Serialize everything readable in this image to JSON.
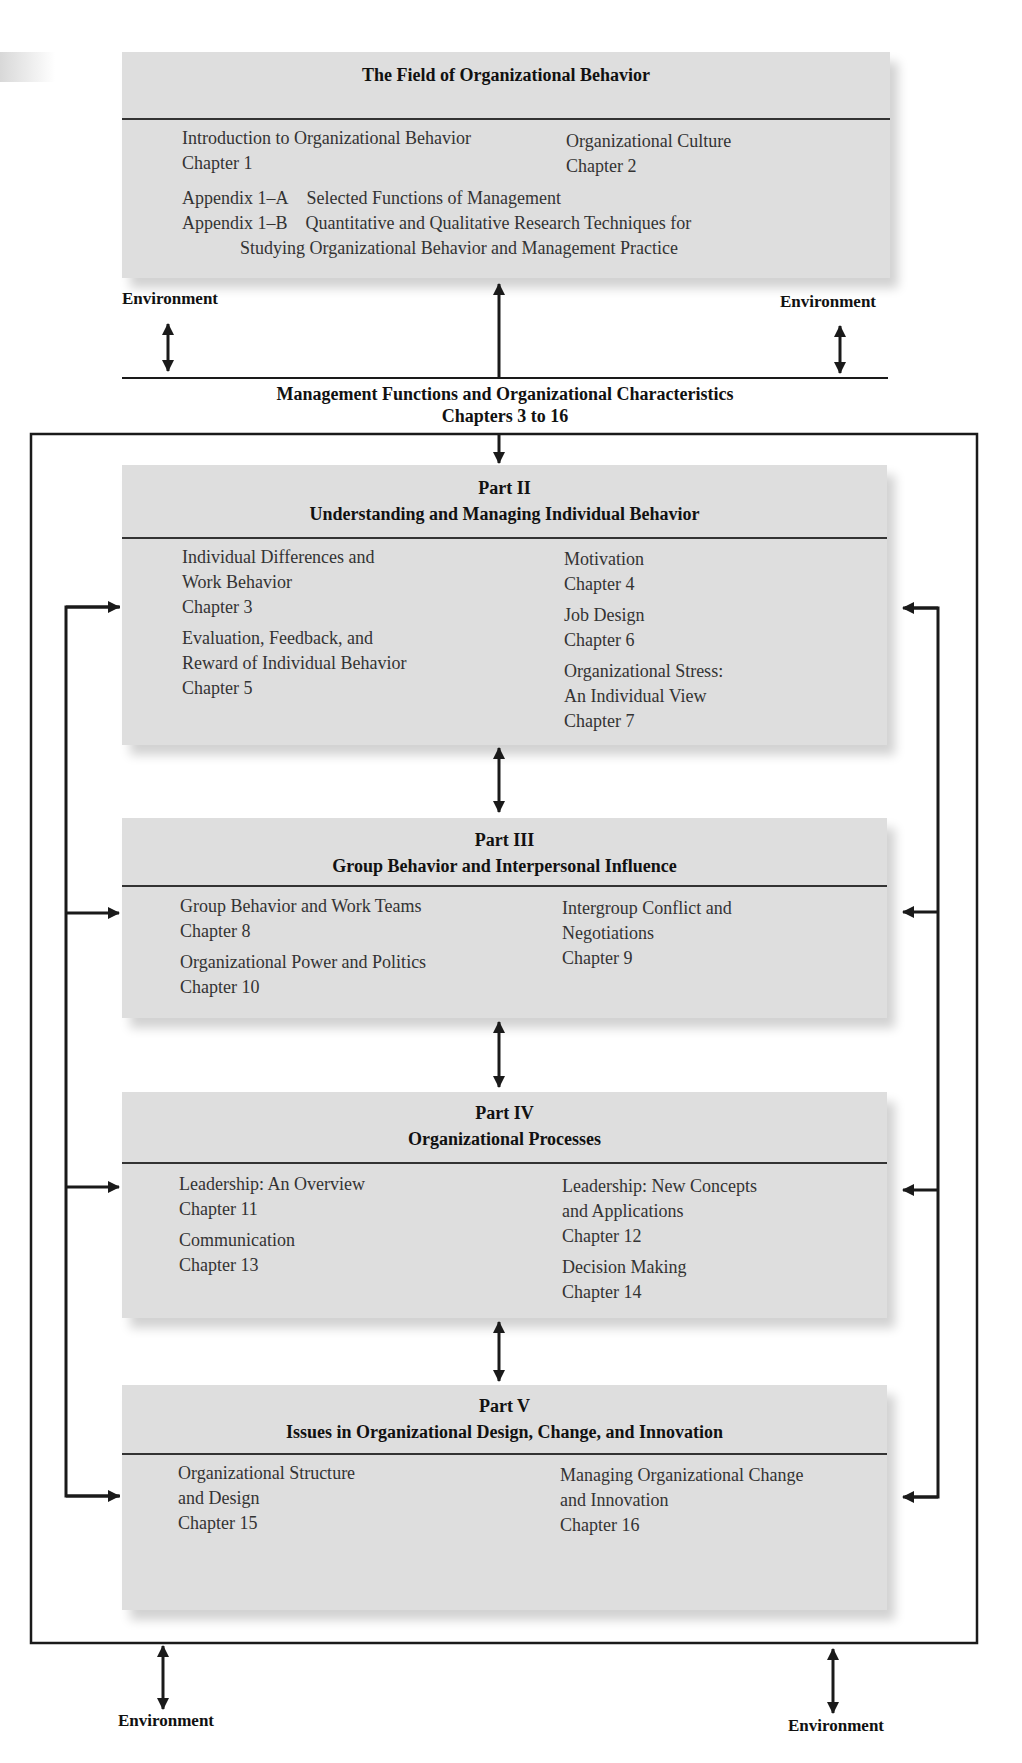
{
  "top_box": {
    "title": "The Field of Organizational Behavior",
    "items": [
      {
        "title": "Introduction to Organizational Behavior",
        "chapter": "Chapter 1"
      },
      {
        "title": "Organizational Culture",
        "chapter": "Chapter 2"
      }
    ],
    "appendices": [
      {
        "label": "Appendix 1–A",
        "text": "Selected Functions of Management"
      },
      {
        "label": "Appendix 1–B",
        "text": "Quantitative and Qualitative Research Techniques for",
        "continuation": "Studying Organizational Behavior and Management Practice"
      }
    ]
  },
  "environment_label": "Environment",
  "management": {
    "title": "Management Functions and Organizational Characteristics",
    "subtitle": "Chapters 3 to 16"
  },
  "parts": [
    {
      "part": "Part II",
      "title": "Understanding and Managing Individual Behavior",
      "left": [
        {
          "lines": [
            "Individual Differences and",
            "Work Behavior",
            "Chapter 3"
          ]
        },
        {
          "lines": [
            "Evaluation, Feedback, and",
            "Reward of Individual Behavior",
            "Chapter 5"
          ]
        }
      ],
      "right": [
        {
          "lines": [
            "Motivation",
            "Chapter 4"
          ]
        },
        {
          "lines": [
            "Job Design",
            "Chapter 6"
          ]
        },
        {
          "lines": [
            "Organizational Stress:",
            "An Individual View",
            "Chapter 7"
          ]
        }
      ]
    },
    {
      "part": "Part III",
      "title": "Group Behavior and Interpersonal Influence",
      "left": [
        {
          "lines": [
            "Group Behavior and Work Teams",
            "Chapter 8"
          ]
        },
        {
          "lines": [
            "Organizational Power and Politics",
            "Chapter 10"
          ]
        }
      ],
      "right": [
        {
          "lines": [
            "Intergroup Conflict and",
            "Negotiations",
            "Chapter 9"
          ]
        }
      ]
    },
    {
      "part": "Part IV",
      "title": "Organizational Processes",
      "left": [
        {
          "lines": [
            "Leadership: An Overview",
            "Chapter 11"
          ]
        },
        {
          "lines": [
            "Communication",
            "Chapter 13"
          ]
        }
      ],
      "right": [
        {
          "lines": [
            "Leadership: New Concepts",
            "and Applications",
            "Chapter 12"
          ]
        },
        {
          "lines": [
            "Decision Making",
            "Chapter 14"
          ]
        }
      ]
    },
    {
      "part": "Part V",
      "title": "Issues in Organizational Design, Change, and Innovation",
      "left": [
        {
          "lines": [
            "Organizational Structure",
            "and Design",
            "Chapter 15"
          ]
        }
      ],
      "right": [
        {
          "lines": [
            "Managing Organizational Change",
            "and Innovation",
            "Chapter 16"
          ]
        }
      ]
    }
  ],
  "colors": {
    "box_fill": "#dedede",
    "line": "#1a1a1a",
    "text": "#333333"
  }
}
